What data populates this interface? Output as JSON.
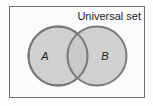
{
  "diagram": {
    "type": "venn",
    "universal_label": "Universal set",
    "sets": [
      {
        "label": "A"
      },
      {
        "label": "B"
      }
    ],
    "colors": {
      "background": "#fdfdfd",
      "border": "#6e6e6e",
      "circle_fill": "#c8c8c8",
      "circle_stroke": "#7a7a7a",
      "text": "#222222"
    }
  }
}
